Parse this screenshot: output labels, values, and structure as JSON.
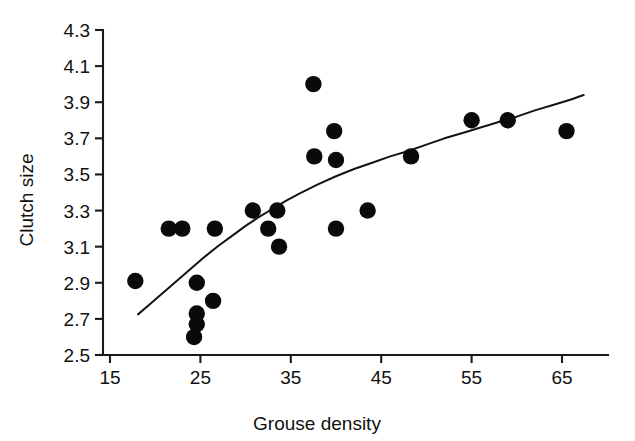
{
  "chart_data": {
    "type": "scatter",
    "title": "",
    "xlabel": "Grouse density",
    "ylabel": "Clutch size",
    "xlim": [
      15,
      68
    ],
    "ylim": [
      2.5,
      4.3
    ],
    "xticks": [
      15,
      25,
      35,
      45,
      55,
      65
    ],
    "xtick_labels": [
      "15",
      "25",
      "35",
      "45",
      "55",
      "65"
    ],
    "yticks": [
      2.5,
      2.7,
      2.9,
      3.1,
      3.3,
      3.5,
      3.7,
      3.9,
      4.1,
      4.3
    ],
    "ytick_labels": [
      "2.5",
      "2.7",
      "2.9",
      "3.1",
      "3.3",
      "3.5",
      "3.7",
      "3.9",
      "4.1",
      "4.3"
    ],
    "grid": false,
    "legend": null,
    "points": [
      {
        "x": 17.8,
        "y": 2.91
      },
      {
        "x": 21.5,
        "y": 3.2
      },
      {
        "x": 23.0,
        "y": 3.2
      },
      {
        "x": 24.3,
        "y": 2.6
      },
      {
        "x": 24.6,
        "y": 2.67
      },
      {
        "x": 24.6,
        "y": 2.73
      },
      {
        "x": 24.6,
        "y": 2.9
      },
      {
        "x": 26.4,
        "y": 2.8
      },
      {
        "x": 26.6,
        "y": 3.2
      },
      {
        "x": 30.8,
        "y": 3.3
      },
      {
        "x": 32.5,
        "y": 3.2
      },
      {
        "x": 33.5,
        "y": 3.3
      },
      {
        "x": 33.7,
        "y": 3.1
      },
      {
        "x": 37.5,
        "y": 4.0
      },
      {
        "x": 37.6,
        "y": 3.6
      },
      {
        "x": 39.8,
        "y": 3.74
      },
      {
        "x": 40.0,
        "y": 3.58
      },
      {
        "x": 40.0,
        "y": 3.2
      },
      {
        "x": 43.5,
        "y": 3.3
      },
      {
        "x": 48.3,
        "y": 3.6
      },
      {
        "x": 55.0,
        "y": 3.8
      },
      {
        "x": 59.0,
        "y": 3.8
      },
      {
        "x": 65.5,
        "y": 3.74
      }
    ],
    "fit_curve": [
      {
        "x": 18.1,
        "y": 2.725
      },
      {
        "x": 19.5,
        "y": 2.785
      },
      {
        "x": 21.0,
        "y": 2.85
      },
      {
        "x": 22.5,
        "y": 2.915
      },
      {
        "x": 24.0,
        "y": 2.98
      },
      {
        "x": 25.5,
        "y": 3.045
      },
      {
        "x": 27.0,
        "y": 3.105
      },
      {
        "x": 28.5,
        "y": 3.16
      },
      {
        "x": 30.0,
        "y": 3.215
      },
      {
        "x": 31.5,
        "y": 3.265
      },
      {
        "x": 33.0,
        "y": 3.31
      },
      {
        "x": 34.5,
        "y": 3.355
      },
      {
        "x": 36.0,
        "y": 3.395
      },
      {
        "x": 38.0,
        "y": 3.445
      },
      {
        "x": 40.0,
        "y": 3.49
      },
      {
        "x": 42.0,
        "y": 3.53
      },
      {
        "x": 44.0,
        "y": 3.565
      },
      {
        "x": 46.0,
        "y": 3.6
      },
      {
        "x": 48.0,
        "y": 3.63
      },
      {
        "x": 50.0,
        "y": 3.665
      },
      {
        "x": 52.0,
        "y": 3.7
      },
      {
        "x": 54.0,
        "y": 3.73
      },
      {
        "x": 56.0,
        "y": 3.76
      },
      {
        "x": 58.0,
        "y": 3.79
      },
      {
        "x": 60.0,
        "y": 3.82
      },
      {
        "x": 62.0,
        "y": 3.855
      },
      {
        "x": 64.0,
        "y": 3.885
      },
      {
        "x": 66.0,
        "y": 3.915
      },
      {
        "x": 67.4,
        "y": 3.94
      }
    ]
  },
  "style": {
    "point_color": "#0a0a0a",
    "curve_color": "#141414",
    "axis_color": "#1a1a1a",
    "background": "#ffffff",
    "point_radius": 8.2
  }
}
